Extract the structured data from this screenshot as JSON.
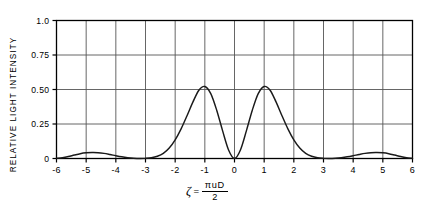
{
  "chart_data": {
    "type": "line",
    "title": "",
    "subtitle": "",
    "xlabel": "ζ = πuD/2",
    "xlabel_parts": {
      "symbol": "ζ",
      "equals": "=",
      "numerator": "πuD",
      "denominator": "2"
    },
    "ylabel": "RELATIVE LIGHT INTENSITY",
    "xlim": [
      -6,
      6
    ],
    "ylim": [
      0,
      1.0
    ],
    "grid": true,
    "legend": null,
    "legend_position": "none",
    "xticks": [
      -6,
      -5,
      -4,
      -3,
      -2,
      -1,
      0,
      1,
      2,
      3,
      4,
      5,
      6
    ],
    "xtick_labels": [
      "-6",
      "-5",
      "-4",
      "-3",
      "-2",
      "-1",
      "0",
      "1",
      "2",
      "3",
      "4",
      "5",
      "6"
    ],
    "yticks": [
      0,
      0.25,
      0.5,
      0.75,
      1.0
    ],
    "ytick_labels": [
      "0",
      "0.25",
      "0.50",
      "0.75",
      "1.0"
    ],
    "line_color": "#1a1a1a",
    "grid_color": "#555555",
    "axis_color": "#000000",
    "background_color": "#ffffff",
    "annotations": [],
    "series": [
      {
        "name": "relative light intensity",
        "x": [
          -6.0,
          -5.8,
          -5.6,
          -5.4,
          -5.2,
          -5.0,
          -4.8,
          -4.6,
          -4.4,
          -4.2,
          -4.0,
          -3.8,
          -3.6,
          -3.4,
          -3.2,
          -3.0,
          -2.8,
          -2.6,
          -2.4,
          -2.2,
          -2.0,
          -1.8,
          -1.6,
          -1.4,
          -1.2,
          -1.0,
          -0.8,
          -0.6,
          -0.4,
          -0.2,
          0.0,
          0.2,
          0.4,
          0.6,
          0.8,
          1.0,
          1.2,
          1.4,
          1.6,
          1.8,
          2.0,
          2.2,
          2.4,
          2.6,
          2.8,
          3.0,
          3.2,
          3.4,
          3.6,
          3.8,
          4.0,
          4.2,
          4.4,
          4.6,
          4.8,
          5.0,
          5.2,
          5.4,
          5.6,
          5.8,
          6.0
        ],
        "y": [
          0.002,
          0.006,
          0.014,
          0.025,
          0.035,
          0.041,
          0.043,
          0.042,
          0.037,
          0.029,
          0.02,
          0.012,
          0.006,
          0.002,
          0.0,
          0.001,
          0.005,
          0.016,
          0.037,
          0.076,
          0.135,
          0.215,
          0.31,
          0.41,
          0.495,
          0.522,
          0.47,
          0.35,
          0.2,
          0.062,
          0.0,
          0.062,
          0.2,
          0.35,
          0.47,
          0.522,
          0.495,
          0.41,
          0.31,
          0.215,
          0.135,
          0.076,
          0.037,
          0.016,
          0.005,
          0.001,
          0.0,
          0.002,
          0.006,
          0.012,
          0.02,
          0.029,
          0.037,
          0.042,
          0.043,
          0.041,
          0.035,
          0.025,
          0.014,
          0.006,
          0.002
        ],
        "peaks": [
          {
            "x": -1.15,
            "y": 0.52,
            "kind": "main-lobe"
          },
          {
            "x": 1.15,
            "y": 0.52,
            "kind": "main-lobe"
          },
          {
            "x": -4.6,
            "y": 0.043,
            "kind": "side-lobe"
          },
          {
            "x": 4.6,
            "y": 0.043,
            "kind": "side-lobe"
          }
        ],
        "zeros": [
          -3.15,
          0.0,
          3.15
        ]
      }
    ]
  }
}
